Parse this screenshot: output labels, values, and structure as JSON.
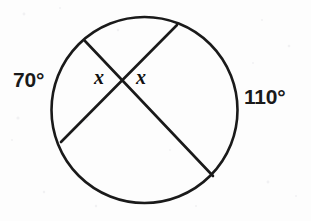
{
  "figure": {
    "background_color": "#fdfdfd",
    "stroke_color": "#1a1a1a",
    "text_color": "#1a1a1a"
  },
  "labels": {
    "arc_left": "70°",
    "arc_right": "110°",
    "angle_left": "x",
    "angle_right": "x"
  },
  "chart_data": {
    "type": "diagram",
    "shape": "circle-with-intersecting-chords",
    "circle": {
      "cx": 144.5,
      "cy": 110,
      "r": 93,
      "stroke_width": 2.6
    },
    "chords": [
      {
        "name": "chord-upper-left-to-lower-right",
        "x1": 85,
        "y1": 41,
        "x2": 213,
        "y2": 176
      },
      {
        "name": "chord-upper-right-to-lower-left",
        "x1": 177,
        "y1": 25,
        "x2": 61,
        "y2": 142
      }
    ],
    "intersection": {
      "x": 125,
      "y": 78
    },
    "arcs": [
      {
        "name": "left-arc",
        "value": 70,
        "label": "70°",
        "position": "outside-left"
      },
      {
        "name": "right-arc",
        "value": 110,
        "label": "110°",
        "position": "outside-right"
      }
    ],
    "angles": [
      {
        "name": "left-vertical-angle",
        "label": "x",
        "position": "left-of-intersection"
      },
      {
        "name": "right-vertical-angle",
        "label": "x",
        "position": "right-of-intersection"
      }
    ]
  }
}
